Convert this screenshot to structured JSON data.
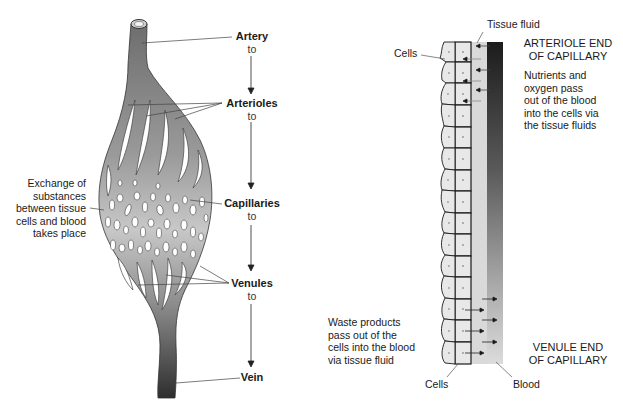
{
  "left_diagram": {
    "sequence": [
      {
        "label": "Artery",
        "connector": "to"
      },
      {
        "label": "Arterioles",
        "connector": "to"
      },
      {
        "label": "Capillaries",
        "connector": "to"
      },
      {
        "label": "Venules",
        "connector": "to"
      },
      {
        "label": "Vein",
        "connector": ""
      }
    ],
    "exchange_note": [
      "Exchange of",
      "substances",
      "between tissue",
      "cells and blood",
      "takes place"
    ]
  },
  "right_diagram": {
    "tissue_fluid_label": "Tissue fluid",
    "cells_label_top": "Cells",
    "cells_label_bottom": "Cells",
    "blood_label": "Blood",
    "arteriole_end": [
      "ARTERIOLE END",
      "OF CAPILLARY"
    ],
    "nutrients_note": [
      "Nutrients and",
      "oxygen pass",
      "out of the blood",
      "into the cells via",
      "the tissue fluids"
    ],
    "venule_end": [
      "VENULE END",
      "OF CAPILLARY"
    ],
    "waste_note": [
      "Waste products",
      "pass out of the",
      "cells into the blood",
      "via tissue fluid"
    ]
  },
  "colors": {
    "vessel_dark": "#3a3a3a",
    "vessel_mid": "#8a8a8a",
    "vessel_light": "#c4c4c4",
    "cell_fill": "#e6e6e6",
    "tissue_fluid": "#d8d8d8",
    "blood_top": "#222222",
    "blood_bottom": "#d0d0d0"
  }
}
